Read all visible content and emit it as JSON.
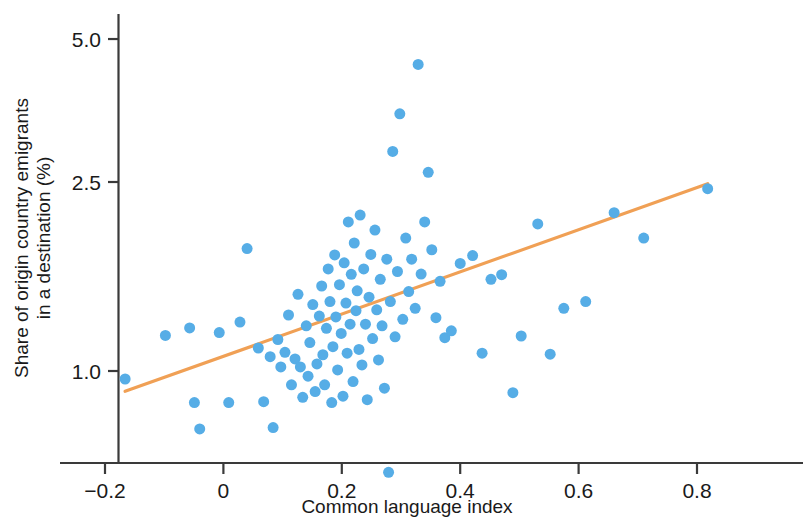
{
  "chart_data": {
    "type": "scatter",
    "title": "",
    "xlabel": "Common language index",
    "ylabel": "Share of origin country emigrants in a destination (%)",
    "xlim": [
      -0.25,
      0.87
    ],
    "ylim": [
      0.58,
      5.6
    ],
    "yscale": "log",
    "grid": false,
    "legend": null,
    "xticks": [
      -0.2,
      0,
      0.2,
      0.4,
      0.6,
      0.8
    ],
    "xticklabels": [
      "−0.2",
      "0",
      "0.2",
      "0.4",
      "0.6",
      "0.8"
    ],
    "yticks": [
      1.0,
      2.5,
      5.0
    ],
    "yticklabels": [
      "1.0",
      "2.5",
      "5.0"
    ],
    "marker_color": "#56ade6",
    "marker_size": 11,
    "trendline": {
      "color": "#f0a055",
      "width": 3.2,
      "x": [
        -0.166,
        0.818
      ],
      "y": [
        0.906,
        2.48
      ]
    },
    "points": [
      {
        "x": -0.166,
        "y": 0.962
      },
      {
        "x": -0.098,
        "y": 1.188
      },
      {
        "x": -0.057,
        "y": 1.232
      },
      {
        "x": -0.049,
        "y": 0.858
      },
      {
        "x": -0.04,
        "y": 0.755
      },
      {
        "x": -0.007,
        "y": 1.205
      },
      {
        "x": 0.009,
        "y": 0.858
      },
      {
        "x": 0.028,
        "y": 1.268
      },
      {
        "x": 0.04,
        "y": 1.81
      },
      {
        "x": 0.059,
        "y": 1.118
      },
      {
        "x": 0.068,
        "y": 0.862
      },
      {
        "x": 0.079,
        "y": 1.072
      },
      {
        "x": 0.084,
        "y": 0.76
      },
      {
        "x": 0.092,
        "y": 1.165
      },
      {
        "x": 0.097,
        "y": 1.02
      },
      {
        "x": 0.104,
        "y": 1.095
      },
      {
        "x": 0.11,
        "y": 1.312
      },
      {
        "x": 0.115,
        "y": 0.935
      },
      {
        "x": 0.121,
        "y": 1.06
      },
      {
        "x": 0.126,
        "y": 1.45
      },
      {
        "x": 0.13,
        "y": 1.02
      },
      {
        "x": 0.134,
        "y": 0.88
      },
      {
        "x": 0.14,
        "y": 1.245
      },
      {
        "x": 0.143,
        "y": 0.975
      },
      {
        "x": 0.146,
        "y": 1.148
      },
      {
        "x": 0.151,
        "y": 1.38
      },
      {
        "x": 0.155,
        "y": 0.905
      },
      {
        "x": 0.158,
        "y": 1.035
      },
      {
        "x": 0.162,
        "y": 1.305
      },
      {
        "x": 0.166,
        "y": 1.51
      },
      {
        "x": 0.168,
        "y": 1.082
      },
      {
        "x": 0.171,
        "y": 0.935
      },
      {
        "x": 0.174,
        "y": 1.23
      },
      {
        "x": 0.177,
        "y": 1.64
      },
      {
        "x": 0.18,
        "y": 1.4
      },
      {
        "x": 0.183,
        "y": 0.858
      },
      {
        "x": 0.185,
        "y": 1.125
      },
      {
        "x": 0.188,
        "y": 1.755
      },
      {
        "x": 0.19,
        "y": 1.3
      },
      {
        "x": 0.193,
        "y": 1.005
      },
      {
        "x": 0.196,
        "y": 1.52
      },
      {
        "x": 0.199,
        "y": 1.2
      },
      {
        "x": 0.202,
        "y": 0.885
      },
      {
        "x": 0.204,
        "y": 1.69
      },
      {
        "x": 0.207,
        "y": 1.39
      },
      {
        "x": 0.209,
        "y": 1.09
      },
      {
        "x": 0.211,
        "y": 2.06
      },
      {
        "x": 0.214,
        "y": 1.255
      },
      {
        "x": 0.216,
        "y": 1.598
      },
      {
        "x": 0.219,
        "y": 0.95
      },
      {
        "x": 0.221,
        "y": 1.86
      },
      {
        "x": 0.224,
        "y": 1.34
      },
      {
        "x": 0.226,
        "y": 1.475
      },
      {
        "x": 0.229,
        "y": 1.11
      },
      {
        "x": 0.231,
        "y": 2.13
      },
      {
        "x": 0.234,
        "y": 1.03
      },
      {
        "x": 0.237,
        "y": 1.64
      },
      {
        "x": 0.24,
        "y": 1.255
      },
      {
        "x": 0.243,
        "y": 0.87
      },
      {
        "x": 0.246,
        "y": 1.43
      },
      {
        "x": 0.249,
        "y": 1.76
      },
      {
        "x": 0.252,
        "y": 1.17
      },
      {
        "x": 0.256,
        "y": 1.98
      },
      {
        "x": 0.259,
        "y": 1.345
      },
      {
        "x": 0.262,
        "y": 1.055
      },
      {
        "x": 0.265,
        "y": 1.56
      },
      {
        "x": 0.268,
        "y": 1.245
      },
      {
        "x": 0.272,
        "y": 0.92
      },
      {
        "x": 0.276,
        "y": 1.72
      },
      {
        "x": 0.279,
        "y": 0.612
      },
      {
        "x": 0.282,
        "y": 1.4
      },
      {
        "x": 0.286,
        "y": 2.9
      },
      {
        "x": 0.29,
        "y": 1.18
      },
      {
        "x": 0.294,
        "y": 1.62
      },
      {
        "x": 0.298,
        "y": 3.48
      },
      {
        "x": 0.303,
        "y": 1.285
      },
      {
        "x": 0.308,
        "y": 1.905
      },
      {
        "x": 0.313,
        "y": 1.47
      },
      {
        "x": 0.318,
        "y": 1.72
      },
      {
        "x": 0.324,
        "y": 1.355
      },
      {
        "x": 0.329,
        "y": 4.42
      },
      {
        "x": 0.334,
        "y": 1.6
      },
      {
        "x": 0.34,
        "y": 2.06
      },
      {
        "x": 0.346,
        "y": 2.62
      },
      {
        "x": 0.352,
        "y": 1.8
      },
      {
        "x": 0.359,
        "y": 1.295
      },
      {
        "x": 0.366,
        "y": 1.545
      },
      {
        "x": 0.374,
        "y": 1.175
      },
      {
        "x": 0.385,
        "y": 1.215
      },
      {
        "x": 0.4,
        "y": 1.685
      },
      {
        "x": 0.421,
        "y": 1.75
      },
      {
        "x": 0.437,
        "y": 1.09
      },
      {
        "x": 0.452,
        "y": 1.56
      },
      {
        "x": 0.47,
        "y": 1.595
      },
      {
        "x": 0.489,
        "y": 0.9
      },
      {
        "x": 0.503,
        "y": 1.185
      },
      {
        "x": 0.531,
        "y": 2.04
      },
      {
        "x": 0.552,
        "y": 1.085
      },
      {
        "x": 0.575,
        "y": 1.355
      },
      {
        "x": 0.612,
        "y": 1.4
      },
      {
        "x": 0.66,
        "y": 2.155
      },
      {
        "x": 0.71,
        "y": 1.905
      },
      {
        "x": 0.818,
        "y": 2.42
      }
    ]
  }
}
